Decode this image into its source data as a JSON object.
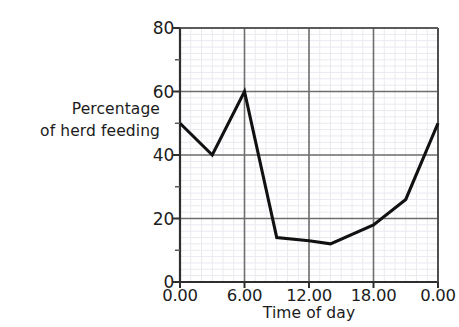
{
  "chart_data": {
    "type": "line",
    "title": "",
    "xlabel": "Time of day",
    "ylabel_lines": [
      "Percentage",
      "of herd feeding"
    ],
    "ylabel": "Percentage of herd feeding",
    "xlim": [
      0,
      24
    ],
    "ylim": [
      0,
      80
    ],
    "x_tick_values": [
      0,
      6,
      12,
      18,
      24
    ],
    "x_tick_labels": [
      "0.00",
      "6.00",
      "12.00",
      "18.00",
      "0.00"
    ],
    "y_tick_values": [
      0,
      20,
      40,
      60,
      80
    ],
    "y_tick_labels": [
      "0",
      "20",
      "40",
      "60",
      "80"
    ],
    "y_minor_tick_values": [
      10,
      30,
      50,
      70
    ],
    "grid": "major gridlines on both axes, faint minor grid inside plot",
    "legend": "none",
    "series": [
      {
        "name": "Percentage of herd feeding",
        "color": "#111111",
        "x": [
          0,
          3,
          6,
          9,
          12,
          14,
          18,
          21,
          24
        ],
        "values": [
          50,
          40,
          60,
          14,
          13,
          12,
          18,
          26,
          50
        ]
      }
    ]
  },
  "axes": {
    "y_title_line1": "Percentage",
    "y_title_line2": "of herd feeding",
    "x_title": "Time of day"
  },
  "ticks": {
    "y": [
      {
        "label": "80",
        "value": 80
      },
      {
        "label": "60",
        "value": 60
      },
      {
        "label": "40",
        "value": 40
      },
      {
        "label": "20",
        "value": 20
      },
      {
        "label": "0",
        "value": 0
      }
    ],
    "x": [
      {
        "label": "0.00",
        "value": 0
      },
      {
        "label": "6.00",
        "value": 6
      },
      {
        "label": "12.00",
        "value": 12
      },
      {
        "label": "18.00",
        "value": 18
      },
      {
        "label": "0.00",
        "value": 24
      }
    ]
  },
  "colors": {
    "background": "#ffffff",
    "line": "#111111",
    "axis": "#3a3a3a",
    "major_grid": "#6e6e6e",
    "minor_grid": "#e9eaf0",
    "text": "#1c1c1c"
  }
}
